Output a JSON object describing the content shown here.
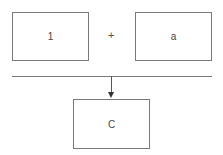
{
  "diagram": {
    "inputs": [
      {
        "label": "1"
      },
      {
        "label": "a"
      }
    ],
    "operator": "+",
    "output": {
      "label": "C"
    },
    "colors": {
      "stroke": "#7a7a7a",
      "arrow": "#333333",
      "background": "#ffffff"
    }
  }
}
